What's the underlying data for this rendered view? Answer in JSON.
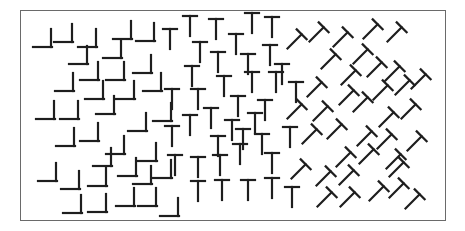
{
  "figure": {
    "frame": {
      "x": 20,
      "y": 10,
      "width": 426,
      "height": 211,
      "color": "#6a6a6a"
    },
    "stroke_color": "#1e1e1e",
    "regions": [
      {
        "name": "L-region",
        "element": "L",
        "rotation": 0,
        "x_range": [
          35,
          175
        ]
      },
      {
        "name": "T-region",
        "element": "T",
        "rotation": 0,
        "x_range": [
          160,
          300
        ]
      },
      {
        "name": "tilted-T-region",
        "element": "T",
        "rotation": 45,
        "x_range": [
          285,
          430
        ]
      }
    ],
    "elements": [
      {
        "t": "L",
        "x": 45,
        "y": 41,
        "r": 0
      },
      {
        "t": "L",
        "x": 66,
        "y": 36,
        "r": 0
      },
      {
        "t": "L",
        "x": 90,
        "y": 41,
        "r": 0
      },
      {
        "t": "L",
        "x": 125,
        "y": 33,
        "r": 0
      },
      {
        "t": "L",
        "x": 148,
        "y": 35,
        "r": 0
      },
      {
        "t": "L",
        "x": 81,
        "y": 58,
        "r": 0
      },
      {
        "t": "L",
        "x": 115,
        "y": 52,
        "r": 0
      },
      {
        "t": "L",
        "x": 92,
        "y": 74,
        "r": 0
      },
      {
        "t": "L",
        "x": 118,
        "y": 74,
        "r": 0
      },
      {
        "t": "L",
        "x": 145,
        "y": 67,
        "r": 0
      },
      {
        "t": "L",
        "x": 67,
        "y": 85,
        "r": 0
      },
      {
        "t": "L",
        "x": 97,
        "y": 93,
        "r": 0
      },
      {
        "t": "L",
        "x": 128,
        "y": 93,
        "r": 0
      },
      {
        "t": "L",
        "x": 155,
        "y": 85,
        "r": 0
      },
      {
        "t": "L",
        "x": 48,
        "y": 113,
        "r": 0
      },
      {
        "t": "L",
        "x": 72,
        "y": 113,
        "r": 0
      },
      {
        "t": "L",
        "x": 108,
        "y": 108,
        "r": 0
      },
      {
        "t": "L",
        "x": 68,
        "y": 140,
        "r": 0
      },
      {
        "t": "L",
        "x": 92,
        "y": 135,
        "r": 0
      },
      {
        "t": "L",
        "x": 118,
        "y": 148,
        "r": 0
      },
      {
        "t": "L",
        "x": 140,
        "y": 125,
        "r": 0
      },
      {
        "t": "L",
        "x": 165,
        "y": 115,
        "r": 0
      },
      {
        "t": "L",
        "x": 105,
        "y": 160,
        "r": 0
      },
      {
        "t": "L",
        "x": 130,
        "y": 170,
        "r": 0
      },
      {
        "t": "L",
        "x": 150,
        "y": 155,
        "r": 0
      },
      {
        "t": "L",
        "x": 50,
        "y": 175,
        "r": 0
      },
      {
        "t": "L",
        "x": 73,
        "y": 183,
        "r": 0
      },
      {
        "t": "L",
        "x": 100,
        "y": 180,
        "r": 0
      },
      {
        "t": "L",
        "x": 145,
        "y": 178,
        "r": 0
      },
      {
        "t": "L",
        "x": 165,
        "y": 172,
        "r": 0
      },
      {
        "t": "L",
        "x": 75,
        "y": 207,
        "r": 0
      },
      {
        "t": "L",
        "x": 100,
        "y": 206,
        "r": 0
      },
      {
        "t": "L",
        "x": 128,
        "y": 200,
        "r": 0
      },
      {
        "t": "L",
        "x": 150,
        "y": 200,
        "r": 0
      },
      {
        "t": "L",
        "x": 172,
        "y": 210,
        "r": 0
      },
      {
        "t": "T",
        "x": 170,
        "y": 37,
        "r": 0
      },
      {
        "t": "T",
        "x": 190,
        "y": 24,
        "r": 0
      },
      {
        "t": "T",
        "x": 216,
        "y": 27,
        "r": 0
      },
      {
        "t": "T",
        "x": 236,
        "y": 42,
        "r": 0
      },
      {
        "t": "T",
        "x": 252,
        "y": 21,
        "r": 0
      },
      {
        "t": "T",
        "x": 272,
        "y": 25,
        "r": 0
      },
      {
        "t": "T",
        "x": 200,
        "y": 50,
        "r": 0
      },
      {
        "t": "T",
        "x": 218,
        "y": 60,
        "r": 0
      },
      {
        "t": "T",
        "x": 248,
        "y": 62,
        "r": 0
      },
      {
        "t": "T",
        "x": 270,
        "y": 53,
        "r": 0
      },
      {
        "t": "T",
        "x": 282,
        "y": 72,
        "r": 0
      },
      {
        "t": "T",
        "x": 192,
        "y": 74,
        "r": 0
      },
      {
        "t": "T",
        "x": 224,
        "y": 84,
        "r": 0
      },
      {
        "t": "T",
        "x": 252,
        "y": 80,
        "r": 0
      },
      {
        "t": "T",
        "x": 276,
        "y": 80,
        "r": 0
      },
      {
        "t": "T",
        "x": 296,
        "y": 90,
        "r": 0
      },
      {
        "t": "T",
        "x": 172,
        "y": 97,
        "r": 0
      },
      {
        "t": "T",
        "x": 198,
        "y": 97,
        "r": 0
      },
      {
        "t": "T",
        "x": 238,
        "y": 104,
        "r": 0
      },
      {
        "t": "T",
        "x": 265,
        "y": 108,
        "r": 0
      },
      {
        "t": "T",
        "x": 190,
        "y": 123,
        "r": 0
      },
      {
        "t": "T",
        "x": 211,
        "y": 116,
        "r": 0
      },
      {
        "t": "T",
        "x": 232,
        "y": 128,
        "r": 0
      },
      {
        "t": "T",
        "x": 255,
        "y": 121,
        "r": 0
      },
      {
        "t": "T",
        "x": 290,
        "y": 135,
        "r": 0
      },
      {
        "t": "T",
        "x": 172,
        "y": 134,
        "r": 0
      },
      {
        "t": "T",
        "x": 218,
        "y": 144,
        "r": 0
      },
      {
        "t": "T",
        "x": 243,
        "y": 137,
        "r": 0
      },
      {
        "t": "T",
        "x": 262,
        "y": 142,
        "r": 0
      },
      {
        "t": "T",
        "x": 175,
        "y": 163,
        "r": 0
      },
      {
        "t": "T",
        "x": 198,
        "y": 165,
        "r": 0
      },
      {
        "t": "T",
        "x": 220,
        "y": 163,
        "r": 0
      },
      {
        "t": "T",
        "x": 240,
        "y": 152,
        "r": 0
      },
      {
        "t": "T",
        "x": 272,
        "y": 161,
        "r": 0
      },
      {
        "t": "T",
        "x": 198,
        "y": 189,
        "r": 0
      },
      {
        "t": "T",
        "x": 222,
        "y": 188,
        "r": 0
      },
      {
        "t": "T",
        "x": 248,
        "y": 188,
        "r": 0
      },
      {
        "t": "T",
        "x": 272,
        "y": 186,
        "r": 0
      },
      {
        "t": "T",
        "x": 292,
        "y": 195,
        "r": 0
      },
      {
        "t": "T",
        "x": 296,
        "y": 40,
        "r": 45
      },
      {
        "t": "T",
        "x": 318,
        "y": 33,
        "r": 45
      },
      {
        "t": "T",
        "x": 342,
        "y": 38,
        "r": 45
      },
      {
        "t": "T",
        "x": 372,
        "y": 30,
        "r": 45
      },
      {
        "t": "T",
        "x": 396,
        "y": 33,
        "r": 45
      },
      {
        "t": "T",
        "x": 330,
        "y": 60,
        "r": 45
      },
      {
        "t": "T",
        "x": 362,
        "y": 55,
        "r": 45
      },
      {
        "t": "T",
        "x": 350,
        "y": 76,
        "r": 45
      },
      {
        "t": "T",
        "x": 376,
        "y": 68,
        "r": 45
      },
      {
        "t": "T",
        "x": 394,
        "y": 72,
        "r": 45
      },
      {
        "t": "T",
        "x": 420,
        "y": 80,
        "r": 45
      },
      {
        "t": "T",
        "x": 316,
        "y": 88,
        "r": 45
      },
      {
        "t": "T",
        "x": 348,
        "y": 96,
        "r": 45
      },
      {
        "t": "T",
        "x": 382,
        "y": 91,
        "r": 45
      },
      {
        "t": "T",
        "x": 404,
        "y": 86,
        "r": 45
      },
      {
        "t": "T",
        "x": 296,
        "y": 110,
        "r": 45
      },
      {
        "t": "T",
        "x": 322,
        "y": 112,
        "r": 45
      },
      {
        "t": "T",
        "x": 362,
        "y": 103,
        "r": 45
      },
      {
        "t": "T",
        "x": 388,
        "y": 118,
        "r": 45
      },
      {
        "t": "T",
        "x": 410,
        "y": 110,
        "r": 45
      },
      {
        "t": "T",
        "x": 311,
        "y": 135,
        "r": 45
      },
      {
        "t": "T",
        "x": 336,
        "y": 130,
        "r": 45
      },
      {
        "t": "T",
        "x": 366,
        "y": 137,
        "r": 45
      },
      {
        "t": "T",
        "x": 386,
        "y": 140,
        "r": 45
      },
      {
        "t": "T",
        "x": 416,
        "y": 142,
        "r": 45
      },
      {
        "t": "T",
        "x": 345,
        "y": 158,
        "r": 45
      },
      {
        "t": "T",
        "x": 368,
        "y": 155,
        "r": 45
      },
      {
        "t": "T",
        "x": 395,
        "y": 160,
        "r": 45
      },
      {
        "t": "T",
        "x": 300,
        "y": 170,
        "r": 45
      },
      {
        "t": "T",
        "x": 325,
        "y": 177,
        "r": 45
      },
      {
        "t": "T",
        "x": 348,
        "y": 176,
        "r": 45
      },
      {
        "t": "T",
        "x": 398,
        "y": 168,
        "r": 45
      },
      {
        "t": "T",
        "x": 326,
        "y": 198,
        "r": 45
      },
      {
        "t": "T",
        "x": 349,
        "y": 198,
        "r": 45
      },
      {
        "t": "T",
        "x": 378,
        "y": 192,
        "r": 45
      },
      {
        "t": "T",
        "x": 398,
        "y": 189,
        "r": 45
      },
      {
        "t": "T",
        "x": 414,
        "y": 200,
        "r": 45
      }
    ]
  }
}
